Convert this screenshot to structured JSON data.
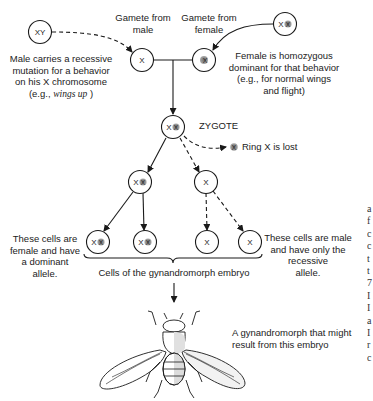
{
  "diagram": {
    "type": "genetics-flow",
    "nodes": {
      "male_parent": {
        "label": "XY"
      },
      "female_parent": {
        "label": "XX"
      },
      "male_gamete": {
        "label": "X"
      },
      "female_gamete": {
        "label": "X"
      },
      "zygote": {
        "label": "XX"
      },
      "ring_x_lost": {
        "label": "X"
      },
      "female_cell_line": {
        "label": "XX"
      },
      "male_cell_line": {
        "label": "X"
      },
      "female_cell_1": {
        "label": "XX"
      },
      "female_cell_2": {
        "label": "XX"
      },
      "male_cell_1": {
        "label": "X"
      },
      "male_cell_2": {
        "label": "X"
      }
    },
    "labels": {
      "gamete_male": "Gamete from male",
      "gamete_female": "Gamete from female",
      "male_desc_1": "Male carries a recessive",
      "male_desc_2": "mutation for a behavior",
      "male_desc_3": "on his X chromosome",
      "male_desc_4_prefix": "(e.g., ",
      "male_desc_4_italic": "wings up",
      "male_desc_4_suffix": " )",
      "female_desc_1": "Female is homozygous",
      "female_desc_2": "dominant for that behavior",
      "female_desc_3": "(e.g., for normal wings",
      "female_desc_4": "and flight)",
      "zygote": "ZYGOTE",
      "ring_lost": "Ring X is lost",
      "female_cells_1": "These cells are",
      "female_cells_2": "female and have",
      "female_cells_3": "a dominant",
      "female_cells_4": "allele.",
      "male_cells_1": "These cells are male",
      "male_cells_2": "and have only the",
      "male_cells_3": "recessive",
      "male_cells_4": "allele.",
      "embryo": "Cells of the gynandromorph embryo",
      "result_1": "A gynandromorph that might",
      "result_2": "result from this embryo"
    },
    "colors": {
      "line": "#1a1a1a",
      "ring_x_fill": "#8a8a8a",
      "background": "#ffffff"
    }
  },
  "edge_fragment": {
    "chars": [
      "a",
      "f",
      "c",
      "c",
      "t",
      "t",
      "7",
      "I",
      "I",
      "a",
      "I",
      "r",
      "c"
    ]
  }
}
